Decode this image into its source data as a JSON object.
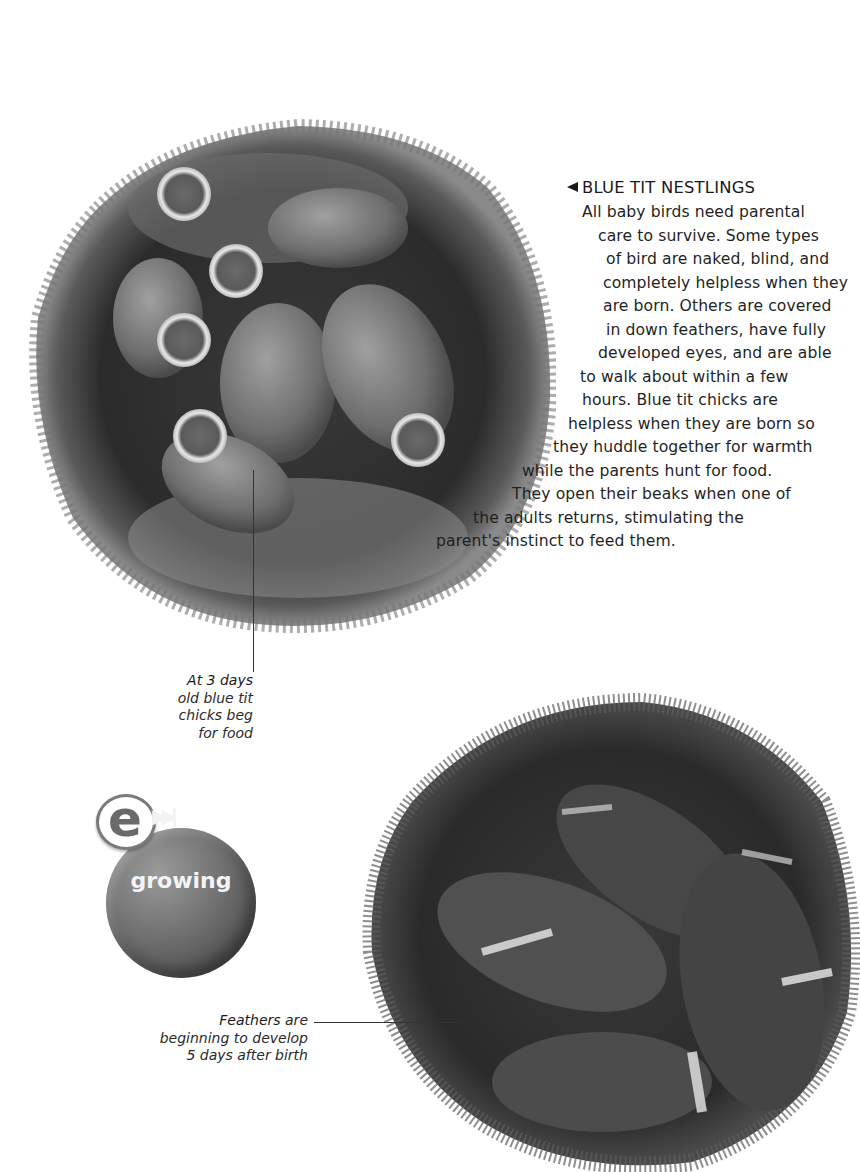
{
  "section": {
    "heading_marker": "◄",
    "heading": "BLUE TIT NESTLINGS",
    "body_lines": [
      "All baby birds need parental",
      "care to survive. Some types",
      "of bird are naked, blind, and",
      "completely helpless when they",
      "are born. Others are covered",
      "in down feathers, have fully",
      "developed eyes, and are able",
      "to walk about within a few",
      "hours. Blue tit chicks are",
      "helpless when they are born so",
      "they huddle together for warmth",
      "while the parents hunt for food.",
      "They open their beaks when one of",
      "the adults returns, stimulating the",
      "parent's instinct to feed them."
    ]
  },
  "captions": {
    "day3": {
      "strong": "At 3 days",
      "lines": [
        "old blue tit",
        "chicks beg",
        "for food"
      ]
    },
    "day5": {
      "strong": "Feathers",
      "rest_first": " are",
      "lines": [
        "beginning to develop",
        "5 days after birth"
      ]
    }
  },
  "e_link": {
    "letter": "e",
    "arrow_glyph": "▶▶|",
    "label": "growing"
  },
  "images": {
    "nest1": "blue-tit-nestlings-3-days",
    "nest2": "blue-tit-nestlings-5-days"
  },
  "colors": {
    "text": "#1a1a1a",
    "badge_gray": "#6a6a6a",
    "background": "#ffffff"
  }
}
